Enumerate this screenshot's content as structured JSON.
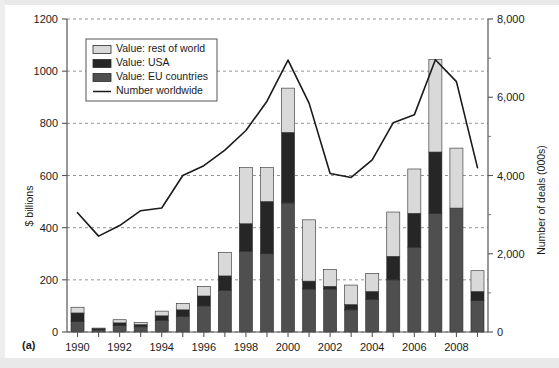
{
  "figure": {
    "panel_label": "(a)",
    "left_axis_title": "$ billions",
    "right_axis_title": "Number of deals (000s)"
  },
  "legend": {
    "items": [
      {
        "label": "Value: rest of world",
        "swatch": "bar-swatch-light",
        "color": "#d9d9d9",
        "type": "bar"
      },
      {
        "label": "Value: USA",
        "swatch": "bar-swatch-dark",
        "color": "#262626",
        "type": "bar"
      },
      {
        "label": "Value: EU countries",
        "swatch": "bar-swatch-mid",
        "color": "#4f4f4f",
        "type": "bar"
      },
      {
        "label": "Number worldwide",
        "swatch": "line-swatch",
        "color": "#1a1a1a",
        "type": "line"
      }
    ]
  },
  "chart_data": {
    "type": "bar",
    "title": "",
    "subtitle": "",
    "xlabel": "",
    "ylabel": "$ billions",
    "y2label": "Number of deals (000s)",
    "ylim": [
      0,
      1200
    ],
    "y2lim": [
      0,
      8000
    ],
    "yticks": [
      0,
      200,
      400,
      600,
      800,
      1000,
      1200
    ],
    "ytick_labels": [
      "0",
      "200",
      "400",
      "600",
      "800",
      "1000",
      "1200"
    ],
    "y2ticks": [
      0,
      2000,
      4000,
      6000,
      8000
    ],
    "y2tick_labels": [
      "0",
      "2,000",
      "4,000",
      "6,000",
      "8,000"
    ],
    "y2_minor_ticks": [
      1000,
      3000,
      5000,
      7000
    ],
    "grid": true,
    "grid_style": "dashed-horizontal",
    "legend_position": "top-left",
    "categories": [
      1990,
      1991,
      1992,
      1993,
      1994,
      1995,
      1996,
      1997,
      1998,
      1999,
      2000,
      2001,
      2002,
      2003,
      2004,
      2005,
      2006,
      2007,
      2008,
      2009
    ],
    "xtick_labels": [
      "1990",
      "",
      "1992",
      "",
      "1994",
      "",
      "1996",
      "",
      "1998",
      "",
      "2000",
      "",
      "2002",
      "",
      "2004",
      "",
      "2006",
      "",
      "2008",
      ""
    ],
    "stacked": true,
    "stack_order": [
      "eu",
      "usa",
      "row"
    ],
    "series": [
      {
        "name": "Value: EU countries",
        "key": "eu",
        "color": "#4f4f4f",
        "values": [
          40,
          8,
          25,
          20,
          45,
          60,
          100,
          160,
          310,
          300,
          495,
          165,
          165,
          85,
          125,
          200,
          325,
          455,
          475,
          120
        ]
      },
      {
        "name": "Value: USA",
        "key": "usa",
        "color": "#262626",
        "values": [
          33,
          4,
          10,
          8,
          17,
          25,
          38,
          55,
          105,
          200,
          270,
          30,
          10,
          20,
          30,
          90,
          130,
          235,
          0,
          35
        ]
      },
      {
        "name": "Value: rest of world",
        "key": "row",
        "color": "#d9d9d9",
        "values": [
          22,
          3,
          12,
          9,
          18,
          25,
          37,
          90,
          215,
          130,
          170,
          235,
          65,
          75,
          70,
          170,
          170,
          355,
          230,
          80
        ]
      }
    ],
    "totals": [
      95,
      15,
      47,
      37,
      80,
      110,
      175,
      305,
      630,
      630,
      935,
      430,
      240,
      180,
      225,
      460,
      625,
      1045,
      705,
      235
    ],
    "line_series": {
      "name": "Number worldwide",
      "color": "#1a1a1a",
      "axis": "right",
      "unit": "deals (000s)",
      "values": [
        3050,
        2450,
        2720,
        3100,
        3170,
        4000,
        4250,
        4650,
        5150,
        5900,
        6950,
        5850,
        4050,
        3950,
        4400,
        5350,
        5550,
        6960,
        6400,
        4200
      ]
    }
  }
}
